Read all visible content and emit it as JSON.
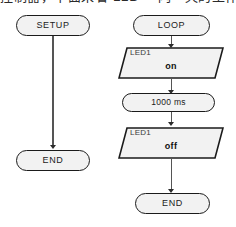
{
  "caption": {
    "text": "控制器，下面来看 LED 一闪一灭的工作过程。"
  },
  "colors": {
    "shape_fill": "#f2f2f2",
    "shape_stroke": "#1b1b1b",
    "connector": "#555555",
    "text": "#1b1b1b",
    "io_title": "#3a3a3a"
  },
  "flowchart": {
    "setup_branch": {
      "name": "setup-branch",
      "nodes": [
        {
          "id": "setup-start",
          "type": "terminal",
          "label": "SETUP"
        },
        {
          "id": "setup-end",
          "type": "terminal",
          "label": "END"
        }
      ]
    },
    "loop_branch": {
      "name": "loop-branch",
      "nodes": [
        {
          "id": "loop-start",
          "type": "terminal",
          "label": "LOOP"
        },
        {
          "id": "led-on",
          "type": "io",
          "title": "LED1",
          "value": "on"
        },
        {
          "id": "delay",
          "type": "process",
          "label": "1000 ms"
        },
        {
          "id": "led-off",
          "type": "io",
          "title": "LED1",
          "value": "off"
        },
        {
          "id": "loop-end",
          "type": "terminal",
          "label": "END"
        }
      ]
    }
  }
}
